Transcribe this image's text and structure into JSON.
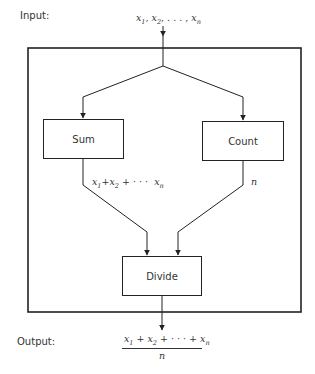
{
  "labels": {
    "input": "Input:",
    "output": "Output:"
  },
  "input_expression": {
    "x1": "x",
    "s1": "1",
    "x2": "x",
    "s2": "2",
    "dots": ", . . . ,",
    "xn": "x",
    "sn": "n"
  },
  "boxes": {
    "sum": "Sum",
    "count": "Count",
    "divide": "Divide"
  },
  "edge_labels": {
    "sum_output": {
      "x1": "x",
      "s1": "1",
      "plus1": "+",
      "x2": "x",
      "s2": "2",
      "plus2": "+ · · ·",
      "xn": "x",
      "sn": "n"
    },
    "count_output": "n"
  },
  "output_expression": {
    "numerator": {
      "x1": "x",
      "s1": "1",
      "plus1": " + ",
      "x2": "x",
      "s2": "2",
      "plus2": " + · · · + ",
      "xn": "x",
      "sn": "n"
    },
    "denominator": "n"
  },
  "colors": {
    "line": "#222222",
    "text": "#333333",
    "background": "#ffffff"
  }
}
